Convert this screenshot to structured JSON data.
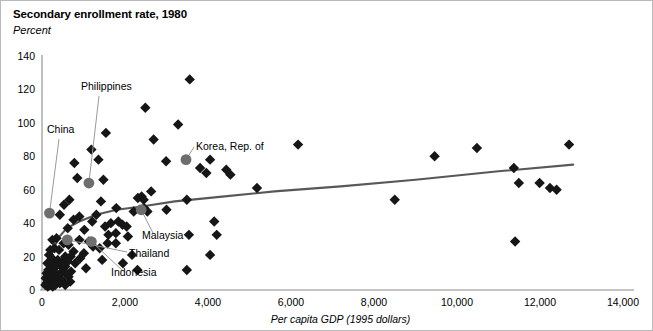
{
  "chart_data": {
    "type": "scatter",
    "title": "Secondary enrollment rate, 1980",
    "subtitle": "Percent",
    "ylabel": "Percent",
    "xlabel": "Per capita GDP (1995 dollars)",
    "xlim": [
      0,
      14000
    ],
    "ylim": [
      0,
      140
    ],
    "xticks": [
      0,
      2000,
      4000,
      6000,
      8000,
      10000,
      12000,
      14000
    ],
    "xtick_labels": [
      "0",
      "2,000",
      "4,000",
      "6,000",
      "8,000",
      "10,000",
      "12,000",
      "14,000"
    ],
    "yticks": [
      0,
      20,
      40,
      60,
      80,
      100,
      120,
      140
    ],
    "ytick_labels": [
      "0",
      "20",
      "40",
      "60",
      "80",
      "100",
      "120",
      "140"
    ],
    "grid": false,
    "legend": "none",
    "marker_style": "diamond",
    "highlight_marker_style": "circle",
    "trendline": {
      "kind": "logarithmic-fit",
      "points": [
        [
          90,
          5
        ],
        [
          140,
          12
        ],
        [
          200,
          19
        ],
        [
          300,
          26
        ],
        [
          420,
          32
        ],
        [
          600,
          37
        ],
        [
          900,
          41
        ],
        [
          1300,
          45
        ],
        [
          1800,
          48
        ],
        [
          2400,
          50
        ],
        [
          3200,
          53
        ],
        [
          4400,
          56
        ],
        [
          5600,
          59
        ],
        [
          7200,
          62
        ],
        [
          9000,
          66
        ],
        [
          11000,
          71
        ],
        [
          12800,
          75
        ]
      ]
    },
    "highlighted_points": [
      {
        "label": "China",
        "x": 180,
        "y": 46
      },
      {
        "label": "Philippines",
        "x": 1130,
        "y": 64
      },
      {
        "label": "Korea, Rep. of",
        "x": 3470,
        "y": 78
      },
      {
        "label": "Malaysia",
        "x": 2390,
        "y": 48
      },
      {
        "label": "Thailand",
        "x": 610,
        "y": 30
      },
      {
        "label": "Indonesia",
        "x": 1190,
        "y": 29
      }
    ],
    "points": [
      [
        3560,
        126
      ],
      [
        2490,
        109
      ],
      [
        3280,
        99
      ],
      [
        1540,
        94
      ],
      [
        2690,
        90
      ],
      [
        6170,
        87
      ],
      [
        12700,
        87
      ],
      [
        10480,
        85
      ],
      [
        1190,
        84
      ],
      [
        9460,
        80
      ],
      [
        1360,
        78
      ],
      [
        780,
        76
      ],
      [
        2990,
        77
      ],
      [
        4050,
        78
      ],
      [
        3810,
        73
      ],
      [
        11370,
        73
      ],
      [
        4440,
        72
      ],
      [
        3960,
        70
      ],
      [
        4540,
        69
      ],
      [
        850,
        67
      ],
      [
        1480,
        66
      ],
      [
        11990,
        64
      ],
      [
        11490,
        64
      ],
      [
        12240,
        61
      ],
      [
        5180,
        61
      ],
      [
        12400,
        60
      ],
      [
        2630,
        59
      ],
      [
        2400,
        56
      ],
      [
        2310,
        55
      ],
      [
        2450,
        54
      ],
      [
        3490,
        54
      ],
      [
        660,
        54
      ],
      [
        8500,
        54
      ],
      [
        1420,
        53
      ],
      [
        530,
        51
      ],
      [
        2460,
        49
      ],
      [
        1790,
        49
      ],
      [
        2540,
        47
      ],
      [
        3000,
        48
      ],
      [
        2210,
        47
      ],
      [
        430,
        45
      ],
      [
        1310,
        45
      ],
      [
        900,
        44
      ],
      [
        760,
        42
      ],
      [
        1210,
        41
      ],
      [
        1840,
        41
      ],
      [
        4150,
        41
      ],
      [
        1660,
        40
      ],
      [
        1940,
        39
      ],
      [
        1520,
        38
      ],
      [
        2040,
        38
      ],
      [
        620,
        37
      ],
      [
        1020,
        36
      ],
      [
        1780,
        34
      ],
      [
        4210,
        33
      ],
      [
        3540,
        33
      ],
      [
        1600,
        33
      ],
      [
        2070,
        32
      ],
      [
        350,
        31
      ],
      [
        250,
        30
      ],
      [
        900,
        30
      ],
      [
        1130,
        29
      ],
      [
        11400,
        29
      ],
      [
        1580,
        28
      ],
      [
        1780,
        28
      ],
      [
        520,
        28
      ],
      [
        640,
        27
      ],
      [
        1230,
        26
      ],
      [
        1390,
        25
      ],
      [
        300,
        25
      ],
      [
        200,
        24
      ],
      [
        410,
        24
      ],
      [
        760,
        23
      ],
      [
        1010,
        22
      ],
      [
        4050,
        21
      ],
      [
        2170,
        21
      ],
      [
        170,
        21
      ],
      [
        560,
        20
      ],
      [
        690,
        20
      ],
      [
        920,
        19
      ],
      [
        240,
        19
      ],
      [
        380,
        18
      ],
      [
        1450,
        18
      ],
      [
        470,
        17
      ],
      [
        620,
        17
      ],
      [
        130,
        16
      ],
      [
        300,
        16
      ],
      [
        800,
        16
      ],
      [
        1950,
        16
      ],
      [
        210,
        15
      ],
      [
        430,
        15
      ],
      [
        560,
        14
      ],
      [
        340,
        14
      ],
      [
        1060,
        13
      ],
      [
        3490,
        12
      ],
      [
        2300,
        12
      ],
      [
        150,
        12
      ],
      [
        260,
        12
      ],
      [
        490,
        11
      ],
      [
        700,
        11
      ],
      [
        110,
        10
      ],
      [
        320,
        10
      ],
      [
        580,
        10
      ],
      [
        180,
        9
      ],
      [
        420,
        9
      ],
      [
        250,
        8
      ],
      [
        640,
        8
      ],
      [
        130,
        8
      ],
      [
        360,
        7
      ],
      [
        90,
        7
      ],
      [
        200,
        6
      ],
      [
        480,
        6
      ],
      [
        300,
        6
      ],
      [
        150,
        5
      ],
      [
        380,
        5
      ],
      [
        240,
        4
      ],
      [
        110,
        4
      ],
      [
        430,
        4
      ],
      [
        320,
        3
      ],
      [
        190,
        3
      ],
      [
        260,
        2
      ],
      [
        140,
        2
      ],
      [
        80,
        3
      ],
      [
        560,
        3
      ],
      [
        680,
        5
      ]
    ]
  }
}
